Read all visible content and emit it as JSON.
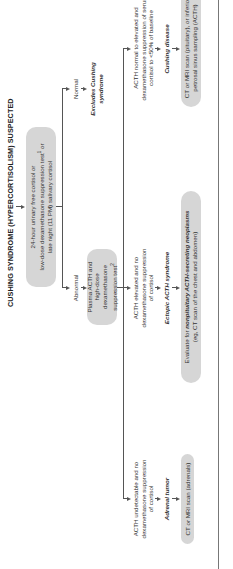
{
  "title": "CUSHING SYNDROME (HYPERCORTISOLISM) SUSPECTED",
  "screening_test": {
    "line1": "24-hour urinary free cortisol or",
    "line2": "low-dose dexamethasone suppression test",
    "sup": "1",
    "line2_tail": " or",
    "line3": "late night (11 PM) salivary cortisol"
  },
  "branches": {
    "normal": {
      "label": "Normal",
      "result_line1": "Excludes Cushing",
      "result_line2": "syndrome"
    },
    "abnormal": {
      "label": "Abnormal",
      "next_test": {
        "line1": "Plasma ACTH and",
        "line2": "high-dose dexamethasone",
        "line3": "suppression test",
        "sup": "2"
      }
    }
  },
  "outcomes": [
    {
      "finding_lines": [
        "ACTH undetectable and no",
        "dexamethasone suppression",
        "of cortisol"
      ],
      "diagnosis": "Adrenal tumor",
      "action_lines": [
        "CT or MRI scan (adrenals)"
      ]
    },
    {
      "finding_lines": [
        "ACTH elevated and no",
        "dexamethasone suppression",
        "of cortisol"
      ],
      "diagnosis_pre": "Ectopic ",
      "diagnosis_em": "ACTH",
      "diagnosis_post": " syndrome",
      "action_pre": "Evaluate for ",
      "action_em": "nonpituitary ACTH-secreting neoplasms",
      "action_line2": "(eg, CT scan of the chest and abdomen)"
    },
    {
      "finding_lines": [
        "ACTH normal to elevated and",
        "dexamethasone suppression of serum",
        "cortisol to <50% of baseline"
      ],
      "diagnosis": "Cushing disease",
      "action_lines": [
        "CT or MRI scan (pituitary), or inferior",
        "petrosal sinus sampling (ACTH)"
      ]
    }
  ],
  "colors": {
    "box_fill": "#d6d6d6",
    "line": "#555555",
    "text": "#333333"
  }
}
